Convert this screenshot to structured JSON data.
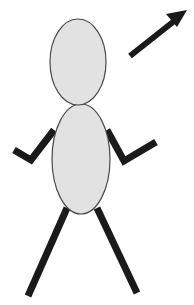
{
  "illustration": {
    "title": "Stick Figure With Upward Arrow",
    "subject": "human-stick-figure",
    "canvas": {
      "width": 194,
      "height": 305,
      "background_color": "#ffffff"
    },
    "palette": {
      "body_fill": "#e2e2e2",
      "body_outline": "#4a4a4a",
      "limb_color": "#1a1a1a",
      "arrow_color": "#1a1a1a",
      "background": "#ffffff"
    },
    "parts": {
      "head": {
        "label": "Head",
        "shape": "ellipse",
        "cx": 78,
        "cy": 62,
        "rx": 28,
        "ry": 43,
        "fill": "#e2e2e2",
        "stroke": "#4a4a4a",
        "stroke_width": 1.2
      },
      "torso": {
        "label": "Torso",
        "shape": "ellipse",
        "cx": 81,
        "cy": 159,
        "rx": 29,
        "ry": 55,
        "fill": "#e2e2e2",
        "stroke": "#4a4a4a",
        "stroke_width": 1.2
      },
      "arm_left": {
        "label": "Left Arm",
        "shape": "polyline",
        "points": "54,130 31,160 14,150",
        "stroke": "#1a1a1a",
        "stroke_width": 7
      },
      "arm_right": {
        "label": "Right Arm",
        "shape": "polyline",
        "points": "107,130 124,161 156,142",
        "stroke": "#1a1a1a",
        "stroke_width": 7
      },
      "leg_left": {
        "label": "Left Leg",
        "shape": "line",
        "points": "67,208 28,296",
        "stroke": "#1a1a1a",
        "stroke_width": 7
      },
      "leg_right": {
        "label": "Right Leg",
        "shape": "line",
        "points": "97,208 137,293",
        "stroke": "#1a1a1a",
        "stroke_width": 7
      },
      "arrow": {
        "label": "Upward Right Arrow",
        "shape": "arrow",
        "shaft_points": "130,56 178,18",
        "head_points": "187,10 166,14 177,27",
        "direction": "up-right",
        "stroke": "#1a1a1a",
        "stroke_width": 6
      }
    }
  }
}
